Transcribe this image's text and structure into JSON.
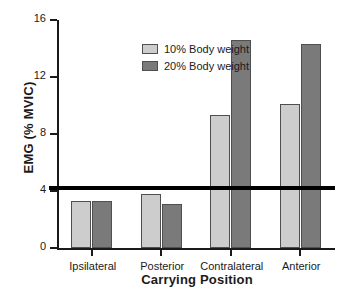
{
  "chart_data": {
    "type": "bar",
    "title": "",
    "xlabel": "Carrying Position",
    "ylabel": "EMG (% MVIC)",
    "categories": [
      "Ipsilateral",
      "Posterior",
      "Contralateral",
      "Anterior"
    ],
    "series": [
      {
        "name": "10% Body weight",
        "color": "#cdcdcd",
        "values": [
          3.3,
          3.8,
          9.3,
          10.1
        ]
      },
      {
        "name": "20% Body weight",
        "color": "#7a7a7a",
        "values": [
          3.3,
          3.1,
          14.6,
          14.3
        ]
      }
    ],
    "ylim": [
      0,
      16
    ],
    "yticks": [
      0,
      4,
      8,
      12,
      16
    ],
    "ytick_labels": [
      "0",
      "4",
      "8",
      "12",
      "16"
    ],
    "grid": false,
    "legend_position": "top-left",
    "annotations": [
      {
        "name": "reference-line",
        "type": "hline",
        "value": 4.2,
        "color": "#000000"
      }
    ]
  },
  "legend": {
    "items": [
      {
        "label": "10% Body weight",
        "color": "#cdcdcd"
      },
      {
        "label": "20% Body weight",
        "color": "#7a7a7a"
      }
    ]
  }
}
